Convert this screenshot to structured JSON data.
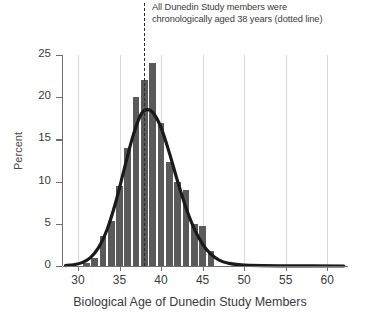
{
  "chart_data": {
    "type": "bar",
    "title": "",
    "annotation": {
      "line1": "All Dunedin Study members were",
      "line2": "chronologically aged 38 years (dotted line)"
    },
    "xlabel": "Biological Age of Dunedin Study Members",
    "ylabel": "Percent",
    "xlim": [
      28.2,
      62.5
    ],
    "ylim": [
      0,
      25
    ],
    "xticks": [
      30,
      35,
      40,
      45,
      50,
      55,
      60
    ],
    "xtick_labels": [
      "30",
      "35",
      "40",
      "45",
      "50",
      "55",
      "60"
    ],
    "yticks": [
      0,
      5,
      10,
      15,
      20,
      25
    ],
    "ytick_labels": [
      "0",
      "5",
      "10",
      "15",
      "20",
      "25"
    ],
    "grid": "vertical",
    "legend": "none",
    "bar_color": "#5a5a5a",
    "curve_color": "#1a1a1a",
    "reference_line": {
      "x": 38,
      "style": "dashed",
      "label": "chronological age 38 years",
      "color": "#2b2b2b"
    },
    "categories": [
      31,
      32,
      33,
      34,
      35,
      36,
      37,
      38,
      39,
      40,
      41,
      42,
      43,
      44,
      45,
      46
    ],
    "values": [
      0.4,
      1.0,
      3.5,
      5.3,
      9.5,
      14.0,
      20.0,
      22.0,
      24.0,
      17.0,
      12.3,
      10.0,
      9.0,
      5.0,
      4.8,
      1.8
    ],
    "series": [
      {
        "name": "Percent of Dunedin Study members",
        "values": [
          0.4,
          1.0,
          3.5,
          5.3,
          9.5,
          14.0,
          20.0,
          22.0,
          24.0,
          17.0,
          12.3,
          10.0,
          9.0,
          5.0,
          4.8,
          1.8
        ]
      },
      {
        "name": "Normal density curve",
        "type": "line",
        "x": [
          28.5,
          29.5,
          30.5,
          31.5,
          32.5,
          33.5,
          34.5,
          35.5,
          36.5,
          37.5,
          38.2,
          39.0,
          40.0,
          41.0,
          42.0,
          43.0,
          44.0,
          45.0,
          46.0,
          47.0,
          48.0,
          50.0,
          55.0,
          62.0
        ],
        "values": [
          0.05,
          0.15,
          0.4,
          1.0,
          2.2,
          4.3,
          7.4,
          11.2,
          15.0,
          17.8,
          18.5,
          18.2,
          16.4,
          13.4,
          10.0,
          6.9,
          4.4,
          2.6,
          1.4,
          0.7,
          0.35,
          0.1,
          0.02,
          0.0
        ]
      }
    ]
  },
  "axis": {
    "y_title": "Percent",
    "x_title": "Biological Age of Dunedin Study Members"
  }
}
